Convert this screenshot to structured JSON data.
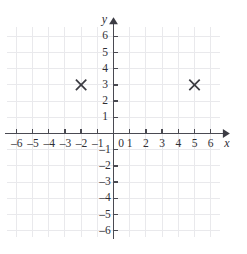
{
  "chart_data": {
    "type": "scatter",
    "title": "",
    "xlabel": "x",
    "ylabel": "y",
    "xlim": [
      -6.9,
      6.9
    ],
    "ylim": [
      -6.6,
      6.9
    ],
    "grid": true,
    "legend": "none",
    "marker": "x-cross",
    "marker_color": "#3a3a40",
    "x_ticks": [
      -6,
      -5,
      -4,
      -3,
      -2,
      -1,
      0,
      1,
      2,
      3,
      4,
      5,
      6
    ],
    "y_ticks": [
      6,
      5,
      4,
      3,
      2,
      1,
      -1,
      -2,
      -3,
      -4,
      -5,
      -6
    ],
    "x_tick_labels": [
      "–6",
      "–5",
      "–4",
      "–3",
      "–2",
      "–1",
      "0",
      "1",
      "2",
      "3",
      "4",
      "5",
      "6"
    ],
    "y_tick_labels": [
      "6",
      "5",
      "4",
      "3",
      "2",
      "1",
      "–1",
      "–2",
      "–3",
      "–4",
      "–5",
      "–6"
    ],
    "origin_label": "0",
    "points": [
      {
        "label": "point-a",
        "x": -2,
        "y": 3
      },
      {
        "label": "point-b",
        "x": 5,
        "y": 3
      }
    ],
    "series": [
      {
        "name": "plotted points",
        "x": [
          -2,
          5
        ],
        "y": [
          3,
          3
        ]
      }
    ],
    "colors": {
      "grid": "#e9e9ec",
      "axis": "#4a4a52",
      "text": "#2e2e34",
      "marker": "#3a3a40",
      "background": "#ffffff"
    }
  }
}
